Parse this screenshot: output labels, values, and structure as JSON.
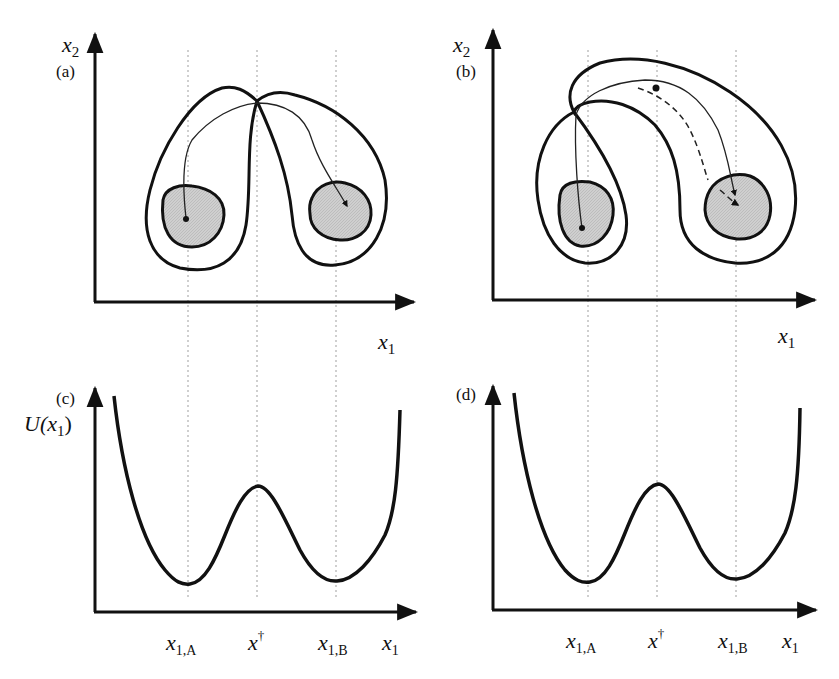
{
  "panels": {
    "a": {
      "tag": "(a)",
      "y_axis": "x",
      "y_axis_sub": "2",
      "x_axis": "x",
      "x_axis_sub": "1"
    },
    "b": {
      "tag": "(b)",
      "y_axis": "x",
      "y_axis_sub": "2",
      "x_axis": "x",
      "x_axis_sub": "1"
    },
    "c": {
      "tag": "(c)",
      "y_axis": "U(x",
      "y_axis_sub": "1",
      "y_axis_close": ")",
      "ticks": [
        {
          "main": "x",
          "sub": "1,A"
        },
        {
          "main": "x",
          "sup": "†"
        },
        {
          "main": "x",
          "sub": "1,B"
        },
        {
          "main": "x",
          "sub": "1"
        }
      ]
    },
    "d": {
      "tag": "(d)",
      "ticks": [
        {
          "main": "x",
          "sub": "1,A"
        },
        {
          "main": "x",
          "sup": "†"
        },
        {
          "main": "x",
          "sub": "1,B"
        },
        {
          "main": "x",
          "sub": "1"
        }
      ]
    }
  },
  "colors": {
    "stroke": "#111111",
    "basin_fill": "#c8c8c8",
    "guide": "#b0b0b0"
  }
}
